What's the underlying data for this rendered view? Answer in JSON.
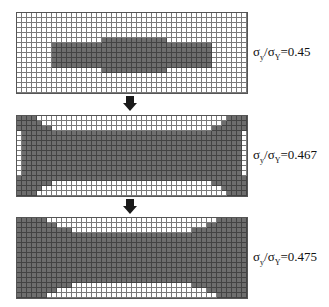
{
  "figure": {
    "grid": {
      "cols": 46,
      "rows": 16,
      "cell_px": 5,
      "dark_color": "#6e6e6e",
      "light_color": "#ffffff"
    },
    "panels": [
      {
        "id": "stage-1",
        "top": 12,
        "label": {
          "sigma": "σ",
          "sub_num": "y",
          "slash": "/",
          "sub_den": "Y",
          "eq": "=0.45"
        },
        "dark_rows": {
          "5": [
            [
              17,
              29
            ]
          ],
          "6": [
            [
              7,
              38
            ]
          ],
          "7": [
            [
              7,
              38
            ]
          ],
          "8": [
            [
              7,
              38
            ]
          ],
          "9": [
            [
              7,
              38
            ]
          ],
          "10": [
            [
              7,
              38
            ]
          ],
          "11": [
            [
              17,
              29
            ]
          ]
        }
      },
      {
        "id": "stage-2",
        "top": 115,
        "label": {
          "sigma": "σ",
          "sub_num": "y",
          "slash": "/",
          "sub_den": "Y",
          "eq": "=0.467"
        },
        "dark_rows": {
          "0": [
            [
              0,
              3
            ],
            [
              42,
              45
            ]
          ],
          "1": [
            [
              0,
              4
            ],
            [
              41,
              45
            ]
          ],
          "2": [
            [
              0,
              6
            ],
            [
              39,
              45
            ]
          ],
          "3": [
            [
              1,
              44
            ]
          ],
          "4": [
            [
              1,
              44
            ]
          ],
          "5": [
            [
              1,
              44
            ]
          ],
          "6": [
            [
              1,
              44
            ]
          ],
          "7": [
            [
              1,
              44
            ]
          ],
          "8": [
            [
              1,
              44
            ]
          ],
          "9": [
            [
              1,
              44
            ]
          ],
          "10": [
            [
              1,
              44
            ]
          ],
          "11": [
            [
              1,
              44
            ]
          ],
          "12": [
            [
              0,
              45
            ]
          ],
          "13": [
            [
              0,
              6
            ],
            [
              39,
              45
            ]
          ],
          "14": [
            [
              0,
              4
            ],
            [
              41,
              45
            ]
          ],
          "15": [
            [
              0,
              3
            ],
            [
              42,
              45
            ]
          ]
        }
      },
      {
        "id": "stage-3",
        "top": 217,
        "label": {
          "sigma": "σ",
          "sub_num": "y",
          "slash": "/",
          "sub_den": "Y",
          "eq": "=0.475"
        },
        "dark_rows": {
          "0": [
            [
              0,
              5
            ],
            [
              40,
              45
            ]
          ],
          "1": [
            [
              0,
              7
            ],
            [
              38,
              45
            ]
          ],
          "2": [
            [
              0,
              10
            ],
            [
              35,
              45
            ]
          ],
          "3": [
            [
              0,
              45
            ]
          ],
          "4": [
            [
              0,
              45
            ]
          ],
          "5": [
            [
              0,
              45
            ]
          ],
          "6": [
            [
              0,
              45
            ]
          ],
          "7": [
            [
              0,
              45
            ]
          ],
          "8": [
            [
              0,
              45
            ]
          ],
          "9": [
            [
              0,
              45
            ]
          ],
          "10": [
            [
              0,
              45
            ]
          ],
          "11": [
            [
              0,
              45
            ]
          ],
          "12": [
            [
              0,
              45
            ]
          ],
          "13": [
            [
              0,
              10
            ],
            [
              35,
              45
            ]
          ],
          "14": [
            [
              0,
              7
            ],
            [
              38,
              45
            ]
          ],
          "15": [
            [
              0,
              5
            ],
            [
              40,
              45
            ]
          ]
        }
      }
    ],
    "arrows": [
      {
        "top": 96,
        "icon": "down-arrow-icon"
      },
      {
        "top": 199,
        "icon": "down-arrow-icon"
      }
    ]
  }
}
